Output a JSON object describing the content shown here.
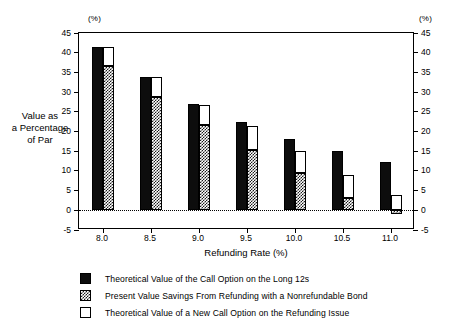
{
  "chart_data": {
    "type": "bar",
    "title": "",
    "xlabel": "Refunding Rate (%)",
    "ylabel": "Value as\na Percentage\nof Par",
    "unit_label_left": "(%)",
    "unit_label_right": "(%)",
    "categories": [
      "8.0",
      "8.5",
      "9.0",
      "9.5",
      "10.0",
      "10.5",
      "11.0"
    ],
    "ylim": [
      -5,
      45
    ],
    "yticks": [
      -5,
      0,
      5,
      10,
      15,
      20,
      25,
      30,
      35,
      40,
      45
    ],
    "ytick_labels": [
      "-5",
      "0",
      "5",
      "10",
      "15",
      "20",
      "25",
      "30",
      "35",
      "40",
      "45"
    ],
    "right_axis": true,
    "right_ytick_labels": [
      "-5",
      "0",
      "5",
      "10",
      "15",
      "20",
      "25",
      "30",
      "35",
      "40",
      "45"
    ],
    "grid": false,
    "zero_reference_line": true,
    "legend_position": "bottom-left",
    "series": [
      {
        "name": "Theoretical Value of the Call Option on the Long 12s",
        "style": "solid-black",
        "color": "#0d0d0d",
        "values": [
          41.5,
          33.8,
          27.0,
          22.3,
          18.0,
          15.0,
          12.3
        ]
      },
      {
        "name": "Present Value Savings From Refunding with a Nonrefundable Bond",
        "style": "checkered",
        "color": "#1a1a1a",
        "values": [
          36.5,
          28.7,
          21.7,
          15.3,
          9.5,
          3.2,
          -1.0
        ]
      },
      {
        "name": "Theoretical Value of a New Call Option on the Refunding Issue",
        "style": "white-outline",
        "color": "#ffffff",
        "values": [
          41.5,
          33.8,
          26.7,
          21.5,
          15.0,
          9.0,
          4.0
        ]
      }
    ]
  },
  "legend": {
    "items": [
      {
        "swatch": "solid-black-swatch",
        "label": "Theoretical Value of the Call Option on the Long 12s"
      },
      {
        "swatch": "checkered-swatch",
        "label": "Present Value Savings From Refunding with a Nonrefundable Bond"
      },
      {
        "swatch": "white-outline-swatch",
        "label": "Theoretical Value of a New Call Option on the Refunding Issue"
      }
    ]
  }
}
